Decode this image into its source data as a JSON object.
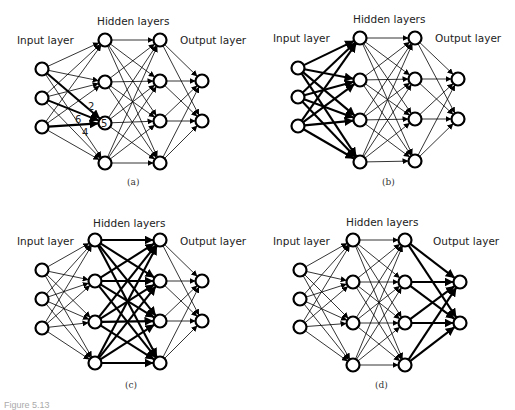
{
  "figure": {
    "caption": "Figure 5.13",
    "panels": [
      {
        "id": "a",
        "sublabel": "(a)",
        "labels": {
          "hidden": "Hidden layers",
          "input": "Input layer",
          "output": "Output layer"
        },
        "input_nodes": [
          [
            42,
            69
          ],
          [
            42,
            98
          ],
          [
            42,
            127
          ]
        ],
        "hidden1_nodes": [
          [
            105,
            40
          ],
          [
            105,
            82
          ],
          [
            105,
            123
          ],
          [
            105,
            163
          ]
        ],
        "hidden2_nodes": [
          [
            160,
            40
          ],
          [
            160,
            81
          ],
          [
            160,
            121
          ],
          [
            160,
            163
          ]
        ],
        "output_nodes": [
          [
            202,
            81
          ],
          [
            202,
            121
          ]
        ],
        "highlight": "input_to_hidden1_node3",
        "weights": [
          {
            "text": "2",
            "x": 88,
            "y": 110
          },
          {
            "text": "6",
            "x": 75,
            "y": 123
          },
          {
            "text": "4",
            "x": 82,
            "y": 136
          },
          {
            "text": "5",
            "x": 101,
            "y": 127
          }
        ],
        "label_pos": {
          "hidden": [
            97,
            25
          ],
          "input": [
            17,
            44
          ],
          "output": [
            180,
            44
          ],
          "sub": [
            127,
            185
          ]
        }
      },
      {
        "id": "b",
        "sublabel": "(b)",
        "labels": {
          "hidden": "Hidden layers",
          "input": "Input layer",
          "output": "Output layer"
        },
        "input_nodes": [
          [
            298,
            68
          ],
          [
            298,
            97
          ],
          [
            298,
            126
          ]
        ],
        "hidden1_nodes": [
          [
            360,
            38
          ],
          [
            360,
            80
          ],
          [
            360,
            120
          ],
          [
            360,
            162
          ]
        ],
        "hidden2_nodes": [
          [
            415,
            38
          ],
          [
            415,
            79
          ],
          [
            415,
            119
          ],
          [
            415,
            161
          ]
        ],
        "output_nodes": [
          [
            458,
            79
          ],
          [
            458,
            119
          ]
        ],
        "highlight": "input_to_hidden1",
        "weights": [],
        "label_pos": {
          "hidden": [
            353,
            23
          ],
          "input": [
            273,
            42
          ],
          "output": [
            435,
            42
          ],
          "sub": [
            382,
            185
          ]
        }
      },
      {
        "id": "c",
        "sublabel": "(c)",
        "labels": {
          "hidden": "Hidden layers",
          "input": "Input layer",
          "output": "Output layer"
        },
        "input_nodes": [
          [
            42,
            270
          ],
          [
            42,
            299
          ],
          [
            42,
            328
          ]
        ],
        "hidden1_nodes": [
          [
            95,
            240
          ],
          [
            95,
            281
          ],
          [
            95,
            322
          ],
          [
            95,
            363
          ]
        ],
        "hidden2_nodes": [
          [
            160,
            240
          ],
          [
            160,
            281
          ],
          [
            160,
            321
          ],
          [
            160,
            363
          ]
        ],
        "output_nodes": [
          [
            202,
            281
          ],
          [
            202,
            321
          ]
        ],
        "highlight": "hidden1_to_hidden2",
        "weights": [],
        "label_pos": {
          "hidden": [
            93,
            227
          ],
          "input": [
            17,
            245
          ],
          "output": [
            180,
            245
          ],
          "sub": [
            125,
            388
          ]
        }
      },
      {
        "id": "d",
        "sublabel": "(d)",
        "labels": {
          "hidden": "Hidden layers",
          "input": "Input layer",
          "output": "Output layer"
        },
        "input_nodes": [
          [
            300,
            270
          ],
          [
            300,
            299
          ],
          [
            300,
            327
          ]
        ],
        "hidden1_nodes": [
          [
            353,
            240
          ],
          [
            353,
            282
          ],
          [
            353,
            323
          ],
          [
            353,
            365
          ]
        ],
        "hidden2_nodes": [
          [
            405,
            240
          ],
          [
            405,
            282
          ],
          [
            405,
            323
          ],
          [
            405,
            365
          ]
        ],
        "output_nodes": [
          [
            460,
            282
          ],
          [
            460,
            323
          ]
        ],
        "highlight": "hidden2_to_output",
        "weights": [],
        "label_pos": {
          "hidden": [
            346,
            226
          ],
          "input": [
            273,
            245
          ],
          "output": [
            433,
            245
          ],
          "sub": [
            375,
            388
          ]
        }
      }
    ]
  }
}
